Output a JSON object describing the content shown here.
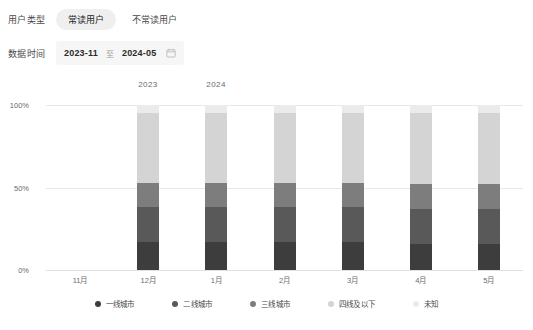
{
  "filters": {
    "user_type": {
      "label": "用户类型",
      "options": [
        {
          "label": "常读用户",
          "active": true
        },
        {
          "label": "不常读用户",
          "active": false
        }
      ]
    },
    "date_range": {
      "label": "数据时间",
      "start": "2023-11",
      "separator": "至",
      "end": "2024-05",
      "icon": "calendar-icon"
    }
  },
  "chart_data": {
    "type": "bar",
    "stacked": true,
    "stack_mode": "percent",
    "title": "",
    "xlabel": "",
    "ylabel": "",
    "ylim": [
      0,
      100
    ],
    "ytick_labels": [
      "0%",
      "50%",
      "100%"
    ],
    "ytick_values": [
      0,
      50,
      100
    ],
    "grid": true,
    "legend_position": "bottom",
    "year_groups": [
      {
        "label": "2023",
        "x_index": 1
      },
      {
        "label": "2024",
        "x_index": 2
      }
    ],
    "categories": [
      "11月",
      "12月",
      "1月",
      "2月",
      "3月",
      "4月",
      "5月"
    ],
    "series": [
      {
        "name": "一线城市",
        "color": "#3d3d3d",
        "values": [
          null,
          17,
          17,
          17,
          17,
          16,
          16
        ]
      },
      {
        "name": "二线城市",
        "color": "#595959",
        "values": [
          null,
          21,
          21,
          21,
          21,
          21,
          21
        ]
      },
      {
        "name": "三线城市",
        "color": "#7d7d7d",
        "values": [
          null,
          15,
          15,
          15,
          15,
          15,
          15
        ]
      },
      {
        "name": "四线及以下",
        "color": "#d4d4d4",
        "values": [
          null,
          42,
          42,
          42,
          42,
          43,
          43
        ]
      },
      {
        "name": "未知",
        "color": "#ebebeb",
        "values": [
          null,
          5,
          5,
          5,
          5,
          5,
          5
        ]
      }
    ]
  }
}
